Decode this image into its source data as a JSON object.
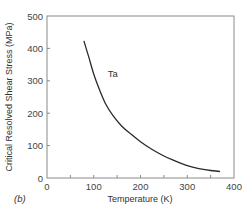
{
  "chart_data": {
    "type": "line",
    "title": "",
    "panel_label": "(b)",
    "xlabel": "Temperature (K)",
    "ylabel": "Critical Resolved Shear Stress (MPa)",
    "xlim": [
      0,
      400
    ],
    "ylim": [
      0,
      500
    ],
    "xticks": [
      0,
      100,
      200,
      300,
      400
    ],
    "xtick_labels": [
      "0",
      "100",
      "200",
      "300",
      "400"
    ],
    "x_minor_ticks": [
      50,
      150,
      250,
      350
    ],
    "yticks": [
      0,
      100,
      200,
      300,
      400,
      500
    ],
    "ytick_labels": [
      "0",
      "100",
      "200",
      "300",
      "400",
      "500"
    ],
    "grid": false,
    "series": [
      {
        "name": "Ta",
        "label_at": [
          130,
          320
        ],
        "x": [
          79,
          90,
          100,
          113,
          125,
          140,
          160,
          180,
          200,
          225,
          250,
          275,
          300,
          325,
          350,
          370
        ],
        "y": [
          423,
          370,
          320,
          270,
          230,
          195,
          160,
          135,
          112,
          88,
          68,
          52,
          38,
          29,
          23,
          20
        ]
      }
    ]
  }
}
